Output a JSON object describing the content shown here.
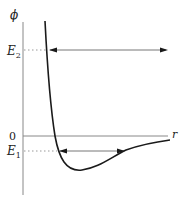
{
  "diagram": {
    "axes": {
      "y_label": "ϕ",
      "x_label": "r",
      "zero_label": "0"
    },
    "levels": [
      {
        "id": "E2",
        "label": "E",
        "subscript": "2",
        "description": "Unbound energy level; arrow extends from curve to the right (open motion)"
      },
      {
        "id": "E1",
        "label": "E",
        "subscript": "1",
        "description": "Bound energy level below zero; double-headed arrow between turning points"
      }
    ],
    "curve": {
      "description": "Potential well: steep repulsive wall at small r, minimum below zero, asymptotically approaching 0 as r increases"
    },
    "colors": {
      "curve": "#1a1a1a",
      "axis": "#888888",
      "dotted": "#999999",
      "arrow": "#777777"
    }
  }
}
